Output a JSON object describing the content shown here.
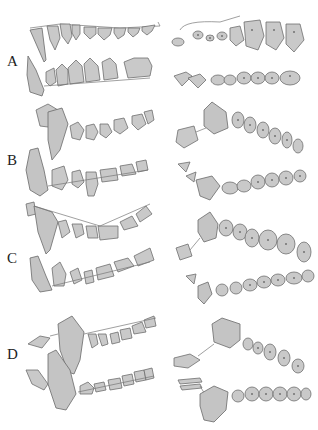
{
  "figure": {
    "type": "dental illustration plate",
    "page_number": "",
    "panels": [
      {
        "id": "A",
        "label": "A",
        "views": [
          "lateral upper",
          "lateral lower",
          "occlusal upper",
          "occlusal lower"
        ]
      },
      {
        "id": "B",
        "label": "B",
        "views": [
          "lateral upper",
          "lateral lower",
          "occlusal upper",
          "occlusal lower"
        ]
      },
      {
        "id": "C",
        "label": "C",
        "views": [
          "lateral upper",
          "lateral lower",
          "occlusal upper",
          "occlusal lower"
        ]
      },
      {
        "id": "D",
        "label": "D",
        "views": [
          "lateral upper",
          "lateral lower",
          "occlusal upper",
          "occlusal lower"
        ]
      }
    ],
    "colors": {
      "tooth_fill": "#c9c9c9",
      "outline": "#6e6e6e",
      "background": "#ffffff",
      "label": "#222222"
    }
  }
}
